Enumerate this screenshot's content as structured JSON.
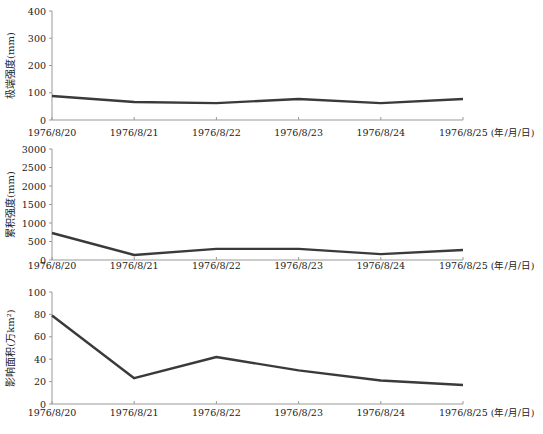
{
  "chart_data": [
    {
      "type": "line",
      "title": "",
      "xlabel": "(年/月/日)",
      "ylabel": "极端强度(mm)",
      "categories": [
        "1976/8/20",
        "1976/8/21",
        "1976/8/22",
        "1976/8/23",
        "1976/8/24",
        "1976/8/25"
      ],
      "series": [
        {
          "name": "极端强度",
          "values": [
            88,
            66,
            62,
            77,
            62,
            77
          ]
        }
      ],
      "ylim": [
        0,
        400
      ],
      "yticks": [
        0,
        100,
        200,
        300,
        400
      ],
      "grid": false
    },
    {
      "type": "line",
      "title": "",
      "xlabel": "(年/月/日)",
      "ylabel": "累积强度(mm)",
      "categories": [
        "1976/8/20",
        "1976/8/21",
        "1976/8/22",
        "1976/8/23",
        "1976/8/24",
        "1976/8/25"
      ],
      "series": [
        {
          "name": "累积强度",
          "values": [
            730,
            135,
            300,
            300,
            160,
            270
          ]
        }
      ],
      "ylim": [
        0,
        3000
      ],
      "yticks": [
        0,
        500,
        1000,
        1500,
        2000,
        2500,
        3000
      ],
      "grid": false
    },
    {
      "type": "line",
      "title": "",
      "xlabel": "(年/月/日)",
      "ylabel": "影响面积(万km²)",
      "categories": [
        "1976/8/20",
        "1976/8/21",
        "1976/8/22",
        "1976/8/23",
        "1976/8/24",
        "1976/8/25"
      ],
      "series": [
        {
          "name": "影响面积",
          "values": [
            79,
            23,
            42,
            30,
            21,
            17
          ]
        }
      ],
      "ylim": [
        0,
        100
      ],
      "yticks": [
        0,
        20,
        40,
        60,
        80,
        100
      ],
      "grid": false
    }
  ],
  "panels": [
    {
      "top": 11,
      "bottom": 120,
      "label_y": 136
    },
    {
      "top": 149,
      "bottom": 260,
      "label_y": 269
    },
    {
      "top": 292,
      "bottom": 404,
      "label_y": 416
    }
  ]
}
